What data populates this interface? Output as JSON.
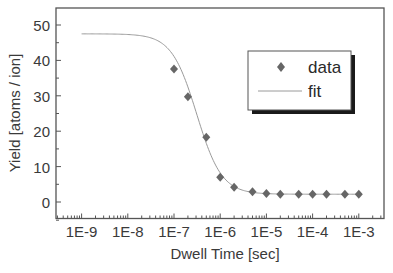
{
  "chart_data": {
    "type": "scatter",
    "title": "",
    "xlabel": "Dwell Time [sec]",
    "ylabel": "Yield [atoms / ion]",
    "xscale": "log",
    "xlim_log10": [
      -9.65,
      -2.45
    ],
    "ylim": [
      -5,
      55
    ],
    "grid": false,
    "legend_position": "upper right (inside)",
    "x_ticks": [
      {
        "log10": -9,
        "label": "1E-9"
      },
      {
        "log10": -8,
        "label": "1E-8"
      },
      {
        "log10": -7,
        "label": "1E-7"
      },
      {
        "log10": -6,
        "label": "1E-6"
      },
      {
        "log10": -5,
        "label": "1E-5"
      },
      {
        "log10": -4,
        "label": "1E-4"
      },
      {
        "log10": -3,
        "label": "1E-3"
      }
    ],
    "y_ticks": [
      {
        "value": 0,
        "label": "0"
      },
      {
        "value": 10,
        "label": "10"
      },
      {
        "value": 20,
        "label": "20"
      },
      {
        "value": 30,
        "label": "30"
      },
      {
        "value": 40,
        "label": "40"
      },
      {
        "value": 50,
        "label": "50"
      }
    ],
    "series": [
      {
        "name": "data",
        "kind": "markers",
        "marker": "diamond",
        "color": "#666666",
        "x": [
          1e-07,
          2e-07,
          5e-07,
          1e-06,
          2e-06,
          5e-06,
          1e-05,
          2e-05,
          5e-05,
          0.0001,
          0.0002,
          0.0005,
          0.001
        ],
        "y": [
          37.6,
          29.7,
          18.3,
          7.0,
          4.2,
          2.9,
          2.4,
          2.2,
          2.2,
          2.2,
          2.2,
          2.2,
          2.2
        ]
      },
      {
        "name": "fit",
        "kind": "line",
        "color": "#9a9a9a",
        "model": "sigmoid_log",
        "x_range": [
          1e-09,
          0.001
        ],
        "params": {
          "A1": 47.5,
          "A2": 2.2,
          "x0": 3.1e-07,
          "p": 1.6
        }
      }
    ]
  },
  "legend": {
    "items": [
      {
        "label": "data"
      },
      {
        "label": "fit"
      }
    ]
  },
  "colors": {
    "axis": "#555555",
    "marker": "#666666",
    "fit_line": "#9a9a9a",
    "legend_shadow": "#1a1a1a"
  }
}
